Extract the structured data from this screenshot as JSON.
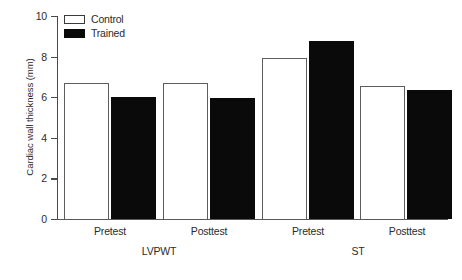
{
  "chart_data": {
    "type": "bar",
    "title": "",
    "xlabel": "",
    "ylabel": "Cardiac wall thickness (mm)",
    "ylim": [
      0,
      10
    ],
    "ytick_labels": [
      "0",
      "2",
      "4",
      "6",
      "8",
      "10"
    ],
    "ytick_values": [
      0,
      2,
      4,
      6,
      8,
      10
    ],
    "grid": false,
    "legend_position": "top-left",
    "categories": [
      "Pretest",
      "Posttest",
      "Pretest",
      "Posttest"
    ],
    "group_labels": [
      "LVPWT",
      "ST"
    ],
    "groups": [
      {
        "group": "LVPWT",
        "condition": "Pretest",
        "bars": [
          {
            "series": "Control",
            "value": 6.7
          },
          {
            "series": "Trained",
            "value": 6.0
          }
        ]
      },
      {
        "group": "LVPWT",
        "condition": "Posttest",
        "bars": [
          {
            "series": "Control",
            "value": 6.7
          },
          {
            "series": "Trained",
            "value": 5.95
          }
        ]
      },
      {
        "group": "ST",
        "condition": "Pretest",
        "bars": [
          {
            "series": "Control",
            "value": 7.95
          },
          {
            "series": "Trained",
            "value": 8.75
          }
        ]
      },
      {
        "group": "ST",
        "condition": "Posttest",
        "bars": [
          {
            "series": "Control",
            "value": 6.55
          },
          {
            "series": "Trained",
            "value": 6.35
          }
        ]
      }
    ],
    "series": [
      {
        "name": "Control",
        "values": [
          6.7,
          6.7,
          7.95,
          6.55
        ],
        "color": "#ffffff"
      },
      {
        "name": "Trained",
        "values": [
          6.0,
          5.95,
          8.75,
          6.35
        ],
        "color": "#0a0a0a"
      }
    ]
  },
  "legend": {
    "items": [
      {
        "label": "Control",
        "swatch": "open-square-swatch"
      },
      {
        "label": "Trained",
        "swatch": "filled-square-swatch"
      }
    ]
  },
  "axes": {
    "y_title": "Cardiac wall thickness (mm)",
    "y_ticks": [
      "10",
      "8",
      "6",
      "4",
      "2",
      "0"
    ]
  },
  "x_labels": {
    "sub": [
      "Pretest",
      "Posttest",
      "Pretest",
      "Posttest"
    ],
    "groups": [
      "LVPWT",
      "ST"
    ]
  }
}
